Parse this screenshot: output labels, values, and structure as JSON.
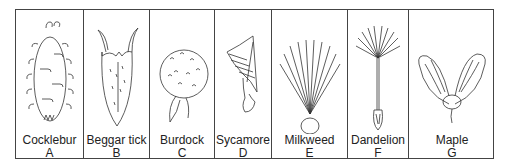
{
  "figure": {
    "panels": [
      {
        "name": "Cocklebur",
        "letter": "A"
      },
      {
        "name": "Beggar tick",
        "letter": "B"
      },
      {
        "name": "Burdock",
        "letter": "C"
      },
      {
        "name": "Sycamore",
        "letter": "D"
      },
      {
        "name": "Milkweed",
        "letter": "E"
      },
      {
        "name": "Dandelion",
        "letter": "F"
      },
      {
        "name": "Maple",
        "letter": "G"
      }
    ]
  }
}
